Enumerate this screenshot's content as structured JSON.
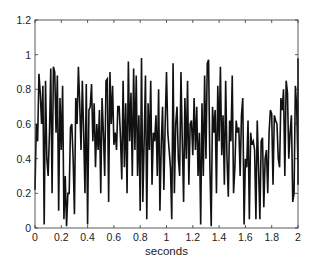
{
  "chart_data": {
    "type": "line",
    "title": "",
    "xlabel": "seconds",
    "ylabel": "",
    "xlim": [
      0,
      2
    ],
    "ylim": [
      0,
      1.2
    ],
    "grid": false,
    "legend": null,
    "x_ticks": [
      "0",
      "0.2",
      "0.4",
      "0.6",
      "0.8",
      "1",
      "1.2",
      "1.4",
      "1.6",
      "1.8",
      "2"
    ],
    "y_ticks": [
      "0",
      "0.2",
      "0.4",
      "0.6",
      "0.8",
      "1",
      "1.2"
    ],
    "line_color": "#111111",
    "series": [
      {
        "name": "signal",
        "x_start": 0,
        "x_step": 0.01,
        "values": [
          0.22,
          0.6,
          0.5,
          0.89,
          0.78,
          0.6,
          0.82,
          0.02,
          0.85,
          0.4,
          0.3,
          0.55,
          0.92,
          0.2,
          0.93,
          0.9,
          0.55,
          0.88,
          0.1,
          0.75,
          0.45,
          0.82,
          0.05,
          0.3,
          0.01,
          0.2,
          0.2,
          0.58,
          0.6,
          0.4,
          0.08,
          0.75,
          0.6,
          0.93,
          0.72,
          0.45,
          0.85,
          0.55,
          0.2,
          0.83,
          0.02,
          0.68,
          0.7,
          0.83,
          0.5,
          0.72,
          0.35,
          0.6,
          0.45,
          0.68,
          0.2,
          0.75,
          0.55,
          0.3,
          0.85,
          0.86,
          0.15,
          0.9,
          0.6,
          0.82,
          0.48,
          0.55,
          0.45,
          0.7,
          0.7,
          0.52,
          0.28,
          0.85,
          0.35,
          0.72,
          0.2,
          0.96,
          0.5,
          0.78,
          0.3,
          0.92,
          0.45,
          0.88,
          0.3,
          0.65,
          0.1,
          0.98,
          0.15,
          0.5,
          0.88,
          0.05,
          0.72,
          0.45,
          0.85,
          0.25,
          0.55,
          0.5,
          0.65,
          0.3,
          0.8,
          0.1,
          0.48,
          0.7,
          0.22,
          0.6,
          0.9,
          0.55,
          0.45,
          0.35,
          0.05,
          0.95,
          0.2,
          0.6,
          0.7,
          0.4,
          0.3,
          0.9,
          0.5,
          0.15,
          0.75,
          0.4,
          0.85,
          0.25,
          0.6,
          0.62,
          0.42,
          0.75,
          0.45,
          0.7,
          0.3,
          0.55,
          0.02,
          0.72,
          0.3,
          0.88,
          0.4,
          0.95,
          0.97,
          0.35,
          0.01,
          0.7,
          0.55,
          0.68,
          0.2,
          0.82,
          0.5,
          0.93,
          0.42,
          0.65,
          0.25,
          0.85,
          0.4,
          0.18,
          0.62,
          0.5,
          0.88,
          0.2,
          0.35,
          0.62,
          0.55,
          0.58,
          0.3,
          0.65,
          0.75,
          0.02,
          0.4,
          0.35,
          0.62,
          0.05,
          0.55,
          0.48,
          0.5,
          0.45,
          0.05,
          0.62,
          0.35,
          0.05,
          0.5,
          0.52,
          0.12,
          0.4,
          0.45,
          0.2,
          0.55,
          0.68,
          0.66,
          0.25,
          0.65,
          0.62,
          0.6,
          0.4,
          0.35,
          0.75,
          0.68,
          0.8,
          0.3,
          0.85,
          0.78,
          0.4,
          0.55,
          0.65,
          0.15,
          0.2,
          0.82,
          0.7,
          0.35,
          0.95,
          0.25,
          0.75,
          0.95,
          0.98
        ]
      }
    ]
  },
  "layout": {
    "plot_left": 35,
    "plot_top": 20,
    "plot_right": 298,
    "plot_bottom": 228
  }
}
